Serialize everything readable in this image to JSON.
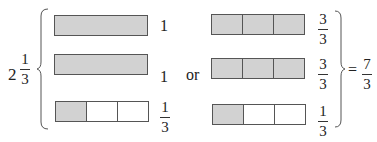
{
  "left_expression": {
    "whole": "2",
    "numerator": "1",
    "denominator": "3"
  },
  "connector": "or",
  "equals": "=",
  "result": {
    "numerator": "7",
    "denominator": "3"
  },
  "colors": {
    "shaded": "#d2d2d2",
    "unshaded": "#ffffff",
    "stroke": "#555555"
  },
  "left_bars": [
    {
      "label": "1",
      "cells": [
        "shaded"
      ]
    },
    {
      "label": "1",
      "cells": [
        "shaded"
      ]
    },
    {
      "label_numerator": "1",
      "label_denominator": "3",
      "cells": [
        "shaded",
        "blank",
        "blank"
      ]
    }
  ],
  "right_bars": [
    {
      "label_numerator": "3",
      "label_denominator": "3",
      "cells": [
        "shaded",
        "shaded",
        "shaded"
      ]
    },
    {
      "label_numerator": "3",
      "label_denominator": "3",
      "cells": [
        "shaded",
        "shaded",
        "shaded"
      ]
    },
    {
      "label_numerator": "1",
      "label_denominator": "3",
      "cells": [
        "shaded",
        "blank",
        "blank"
      ]
    }
  ]
}
